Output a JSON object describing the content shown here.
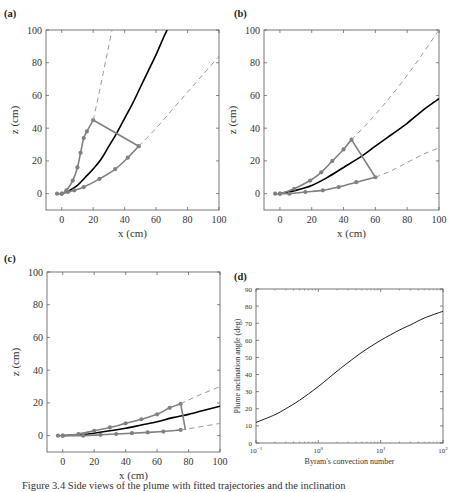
{
  "figure": {
    "caption": "Figure 3.4 Side views of the plume with fitted trajectories and the inclination"
  },
  "colors": {
    "centerline": "#000000",
    "edge": "#808080",
    "dashed": "#999999",
    "frame": "#555555"
  },
  "chart_data": [
    {
      "panel": "(a)",
      "type": "line",
      "xlabel": "x (cm)",
      "ylabel": "z (cm)",
      "xlim": [
        -10,
        100
      ],
      "ylim": [
        -10,
        100
      ],
      "xticks": [
        0,
        20,
        40,
        60,
        80,
        100
      ],
      "yticks": [
        0,
        20,
        40,
        60,
        80,
        100
      ],
      "series": [
        {
          "name": "centerline",
          "style": "solid-black",
          "x": [
            0,
            5,
            10,
            15,
            20,
            25,
            30,
            35,
            40,
            45,
            50,
            55,
            60,
            65,
            67
          ],
          "y": [
            0,
            2,
            5,
            10,
            15,
            21,
            29,
            37,
            46,
            55,
            65,
            75,
            85,
            96,
            100
          ]
        },
        {
          "name": "upper-edge-fit",
          "style": "solid-grey-markers",
          "x": [
            -3,
            0,
            3,
            7,
            10,
            12,
            14,
            16,
            20
          ],
          "y": [
            0,
            0,
            2,
            8,
            16,
            25,
            34,
            38,
            45
          ]
        },
        {
          "name": "upper-edge-extrapolation",
          "style": "dashed-grey",
          "x": [
            20,
            23,
            26,
            29,
            32
          ],
          "y": [
            45,
            58,
            72,
            86,
            100
          ]
        },
        {
          "name": "lower-edge-fit",
          "style": "solid-grey-markers",
          "x": [
            0,
            4,
            8,
            14,
            24,
            34,
            42,
            49
          ],
          "y": [
            0,
            1,
            2,
            4,
            9,
            15,
            22,
            29
          ]
        },
        {
          "name": "lower-edge-extrapolation",
          "style": "dashed-grey",
          "x": [
            49,
            60,
            70,
            80,
            90,
            100
          ],
          "y": [
            29,
            40,
            51,
            62,
            73,
            84
          ]
        },
        {
          "name": "cross-section",
          "style": "solid-grey",
          "x": [
            20,
            49
          ],
          "y": [
            45,
            29
          ]
        }
      ]
    },
    {
      "panel": "(b)",
      "type": "line",
      "xlabel": "x (cm)",
      "ylabel": "z (cm)",
      "xlim": [
        -10,
        100
      ],
      "ylim": [
        -10,
        100
      ],
      "xticks": [
        0,
        20,
        40,
        60,
        80,
        100
      ],
      "yticks": [
        0,
        20,
        40,
        60,
        80,
        100
      ],
      "series": [
        {
          "name": "centerline",
          "style": "solid-black",
          "x": [
            0,
            10,
            20,
            30,
            40,
            50,
            60,
            70,
            80,
            90,
            100
          ],
          "y": [
            0,
            2,
            5,
            10,
            16,
            22,
            29,
            36,
            43,
            51,
            58
          ]
        },
        {
          "name": "upper-edge-fit",
          "style": "solid-grey-markers",
          "x": [
            -3,
            0,
            9,
            19,
            26,
            33,
            40,
            45
          ],
          "y": [
            0,
            0,
            3,
            8,
            13,
            20,
            27,
            33
          ]
        },
        {
          "name": "upper-edge-extrapolation",
          "style": "dashed-grey",
          "x": [
            45,
            55,
            65,
            75,
            85,
            100
          ],
          "y": [
            33,
            43,
            54,
            66,
            79,
            100
          ]
        },
        {
          "name": "lower-edge-fit",
          "style": "solid-grey-markers",
          "x": [
            0,
            6,
            16,
            27,
            37,
            48,
            60
          ],
          "y": [
            0,
            0,
            1,
            2,
            4,
            7,
            10
          ]
        },
        {
          "name": "lower-edge-extrapolation",
          "style": "dashed-grey",
          "x": [
            60,
            70,
            80,
            90,
            100
          ],
          "y": [
            10,
            14,
            19,
            24,
            28
          ]
        },
        {
          "name": "cross-section",
          "style": "solid-grey",
          "x": [
            45,
            60
          ],
          "y": [
            33,
            10
          ]
        }
      ]
    },
    {
      "panel": "(c)",
      "type": "line",
      "xlabel": "x (cm)",
      "ylabel": "z (cm)",
      "xlim": [
        -10,
        100
      ],
      "ylim": [
        -10,
        100
      ],
      "xticks": [
        0,
        20,
        40,
        60,
        80,
        100
      ],
      "yticks": [
        0,
        20,
        40,
        60,
        80,
        100
      ],
      "series": [
        {
          "name": "centerline",
          "style": "solid-black",
          "x": [
            0,
            10,
            20,
            30,
            40,
            50,
            60,
            70,
            80,
            90,
            100
          ],
          "y": [
            0,
            0.5,
            1.5,
            3,
            4.5,
            6.5,
            8.5,
            11,
            13,
            15.5,
            18
          ]
        },
        {
          "name": "upper-edge-fit",
          "style": "solid-grey-markers",
          "x": [
            -3,
            0,
            10,
            20,
            30,
            40,
            50,
            60,
            68,
            75
          ],
          "y": [
            0,
            0,
            1,
            3,
            5,
            7.5,
            10,
            13,
            17,
            19.5
          ]
        },
        {
          "name": "upper-edge-extrapolation",
          "style": "dashed-grey",
          "x": [
            75,
            85,
            100
          ],
          "y": [
            19.5,
            24,
            30
          ]
        },
        {
          "name": "lower-edge-fit",
          "style": "solid-grey-markers",
          "x": [
            0,
            13,
            24,
            34,
            44,
            54,
            64,
            75
          ],
          "y": [
            0,
            0,
            0.5,
            1,
            1.5,
            2,
            2.5,
            3.5
          ]
        },
        {
          "name": "lower-edge-extrapolation",
          "style": "dashed-grey",
          "x": [
            75,
            85,
            100
          ],
          "y": [
            3.5,
            5,
            7.5
          ]
        },
        {
          "name": "cross-section",
          "style": "solid-grey",
          "x": [
            75,
            78
          ],
          "y": [
            19.5,
            3.5
          ]
        }
      ]
    },
    {
      "panel": "(d)",
      "type": "line",
      "xlabel": "Byram's convection number",
      "ylabel": "Plume inclination angle (deg)",
      "xscale": "log",
      "xlim": [
        0.1,
        100
      ],
      "ylim": [
        0,
        90
      ],
      "xticks": [
        "10^-1",
        "10^0",
        "10^1",
        "10^2"
      ],
      "yticks": [
        0,
        10,
        20,
        30,
        40,
        50,
        60,
        70,
        80,
        90
      ],
      "series": [
        {
          "name": "inclination",
          "style": "solid-black-thin",
          "x": [
            0.1,
            0.2,
            0.3,
            0.5,
            1,
            2,
            3,
            5,
            10,
            20,
            30,
            50,
            100
          ],
          "y": [
            12,
            16.5,
            20,
            25,
            33,
            42,
            47,
            53,
            60,
            66,
            69,
            73,
            77
          ]
        }
      ]
    }
  ]
}
